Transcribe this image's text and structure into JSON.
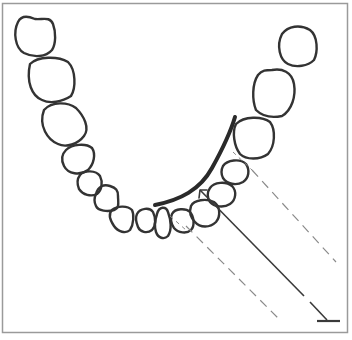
{
  "diagram": {
    "title": "Dental arch with X-ray beam projection",
    "colors": {
      "background": "#ffffff",
      "frame": "#9a9a9a",
      "tooth_outline": "#333333",
      "film_curve": "#2a2a2a",
      "beam_line": "#3a3a3a",
      "dashed_line": "#8a8a8a"
    },
    "elements": {
      "teeth_count": 16,
      "film": "thick curved line along lingual side of arch",
      "central_ray": "solid line with arrowhead pointing toward arch, ending in T-bar (tube)",
      "beam_edges": "two dashed parallel lines"
    }
  }
}
